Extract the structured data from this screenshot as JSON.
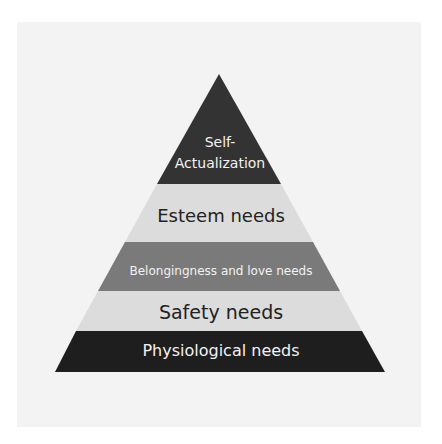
{
  "diagram": {
    "type": "pyramid",
    "tiers": [
      {
        "label_line1": "Self-",
        "label_line2": "Actualization",
        "color": "#333333",
        "text_color": "#f2f2f2"
      },
      {
        "label": "Esteem needs",
        "color": "#dcdcdc",
        "text_color": "#222222"
      },
      {
        "label": "Belongingness and love needs",
        "color": "#7a7a7a",
        "text_color": "#f2f2f2"
      },
      {
        "label": "Safety needs",
        "color": "#dcdcdc",
        "text_color": "#222222"
      },
      {
        "label": "Physiological needs",
        "color": "#1e1e1e",
        "text_color": "#f2f2f2"
      }
    ]
  }
}
